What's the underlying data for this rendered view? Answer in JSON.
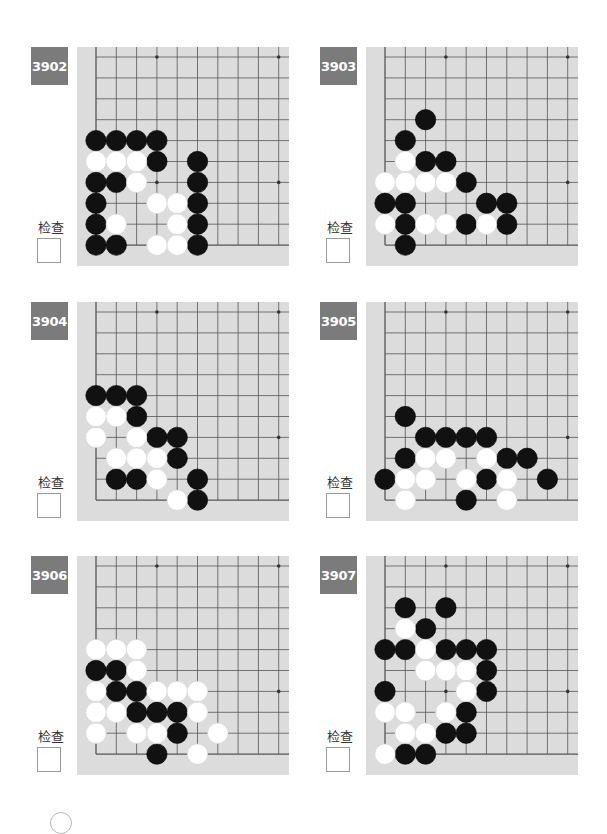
{
  "page": {
    "check_label": "检查",
    "colors": {
      "label_bg": "#7b7b7b",
      "board_bg": "#dcdcdc",
      "grid_line": "#555555",
      "black_stone": "#111111",
      "white_stone": "#ffffff"
    }
  },
  "board_geometry": {
    "grid_origin_x": 19,
    "grid_origin_y": 10,
    "col_spacing": 20.3,
    "row_spacing": 20.9,
    "cols": 10,
    "rows": 10,
    "star_points": [
      [
        3,
        0
      ],
      [
        9,
        0
      ],
      [
        3,
        6
      ],
      [
        9,
        6
      ]
    ],
    "stone_radius": 10.2
  },
  "problems": [
    {
      "number": "3902",
      "position": {
        "left": 31,
        "top": 47
      },
      "stones": {
        "black": [
          [
            0,
            4
          ],
          [
            1,
            4
          ],
          [
            2,
            4
          ],
          [
            3,
            4
          ],
          [
            3,
            5
          ],
          [
            5,
            5
          ],
          [
            0,
            6
          ],
          [
            1,
            6
          ],
          [
            5,
            6
          ],
          [
            0,
            7
          ],
          [
            5,
            7
          ],
          [
            0,
            8
          ],
          [
            5,
            8
          ],
          [
            0,
            9
          ],
          [
            1,
            9
          ],
          [
            5,
            9
          ]
        ],
        "white": [
          [
            0,
            5
          ],
          [
            1,
            5
          ],
          [
            2,
            5
          ],
          [
            2,
            6
          ],
          [
            3,
            7
          ],
          [
            4,
            7
          ],
          [
            1,
            8
          ],
          [
            4,
            8
          ],
          [
            3,
            9
          ],
          [
            4,
            9
          ]
        ]
      }
    },
    {
      "number": "3903",
      "position": {
        "left": 320,
        "top": 47
      },
      "stones": {
        "black": [
          [
            2,
            3
          ],
          [
            1,
            4
          ],
          [
            2,
            5
          ],
          [
            3,
            5
          ],
          [
            4,
            6
          ],
          [
            0,
            7
          ],
          [
            1,
            7
          ],
          [
            5,
            7
          ],
          [
            6,
            7
          ],
          [
            1,
            8
          ],
          [
            4,
            8
          ],
          [
            6,
            8
          ],
          [
            1,
            9
          ]
        ],
        "white": [
          [
            1,
            5
          ],
          [
            0,
            6
          ],
          [
            1,
            6
          ],
          [
            2,
            6
          ],
          [
            3,
            6
          ],
          [
            0,
            8
          ],
          [
            2,
            8
          ],
          [
            3,
            8
          ],
          [
            5,
            8
          ]
        ]
      }
    },
    {
      "number": "3904",
      "position": {
        "left": 31,
        "top": 302
      },
      "stones": {
        "black": [
          [
            0,
            4
          ],
          [
            1,
            4
          ],
          [
            2,
            4
          ],
          [
            2,
            5
          ],
          [
            3,
            6
          ],
          [
            4,
            6
          ],
          [
            4,
            7
          ],
          [
            1,
            8
          ],
          [
            2,
            8
          ],
          [
            5,
            8
          ],
          [
            5,
            9
          ]
        ],
        "white": [
          [
            0,
            5
          ],
          [
            1,
            5
          ],
          [
            0,
            6
          ],
          [
            2,
            6
          ],
          [
            1,
            7
          ],
          [
            2,
            7
          ],
          [
            3,
            7
          ],
          [
            3,
            8
          ],
          [
            4,
            9
          ]
        ]
      }
    },
    {
      "number": "3905",
      "position": {
        "left": 320,
        "top": 302
      },
      "stones": {
        "black": [
          [
            1,
            5
          ],
          [
            2,
            6
          ],
          [
            3,
            6
          ],
          [
            4,
            6
          ],
          [
            5,
            6
          ],
          [
            1,
            7
          ],
          [
            6,
            7
          ],
          [
            7,
            7
          ],
          [
            0,
            8
          ],
          [
            5,
            8
          ],
          [
            8,
            8
          ],
          [
            4,
            9
          ]
        ],
        "white": [
          [
            2,
            7
          ],
          [
            3,
            7
          ],
          [
            5,
            7
          ],
          [
            1,
            8
          ],
          [
            2,
            8
          ],
          [
            4,
            8
          ],
          [
            6,
            8
          ],
          [
            1,
            9
          ],
          [
            6,
            9
          ]
        ]
      }
    },
    {
      "number": "3906",
      "position": {
        "left": 31,
        "top": 556
      },
      "stones": {
        "black": [
          [
            0,
            5
          ],
          [
            1,
            5
          ],
          [
            1,
            6
          ],
          [
            2,
            6
          ],
          [
            2,
            7
          ],
          [
            3,
            7
          ],
          [
            4,
            7
          ],
          [
            4,
            8
          ],
          [
            3,
            9
          ]
        ],
        "white": [
          [
            0,
            4
          ],
          [
            1,
            4
          ],
          [
            2,
            4
          ],
          [
            2,
            5
          ],
          [
            0,
            6
          ],
          [
            3,
            6
          ],
          [
            4,
            6
          ],
          [
            5,
            6
          ],
          [
            0,
            7
          ],
          [
            1,
            7
          ],
          [
            5,
            7
          ],
          [
            0,
            8
          ],
          [
            2,
            8
          ],
          [
            3,
            8
          ],
          [
            6,
            8
          ],
          [
            5,
            9
          ]
        ]
      }
    },
    {
      "number": "3907",
      "position": {
        "left": 320,
        "top": 556
      },
      "stones": {
        "black": [
          [
            1,
            2
          ],
          [
            3,
            2
          ],
          [
            2,
            3
          ],
          [
            0,
            4
          ],
          [
            1,
            4
          ],
          [
            3,
            4
          ],
          [
            4,
            4
          ],
          [
            5,
            4
          ],
          [
            5,
            5
          ],
          [
            0,
            6
          ],
          [
            5,
            6
          ],
          [
            4,
            7
          ],
          [
            3,
            8
          ],
          [
            4,
            8
          ],
          [
            1,
            9
          ],
          [
            2,
            9
          ]
        ],
        "white": [
          [
            1,
            3
          ],
          [
            2,
            4
          ],
          [
            2,
            5
          ],
          [
            3,
            5
          ],
          [
            4,
            5
          ],
          [
            4,
            6
          ],
          [
            0,
            7
          ],
          [
            1,
            7
          ],
          [
            3,
            7
          ],
          [
            1,
            8
          ],
          [
            2,
            8
          ],
          [
            0,
            9
          ]
        ]
      }
    }
  ]
}
